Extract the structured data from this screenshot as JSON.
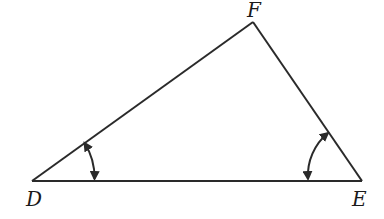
{
  "diagram": {
    "type": "triangle",
    "stroke_color": "#2a2a2a",
    "vertices": {
      "D": {
        "label": "D",
        "x": 32,
        "y": 181
      },
      "E": {
        "label": "E",
        "x": 362,
        "y": 181
      },
      "F": {
        "label": "F",
        "x": 253,
        "y": 22
      }
    },
    "sides": [
      "DE",
      "EF",
      "FD"
    ],
    "angle_marks": [
      {
        "vertex": "D",
        "style": "double-arrow-arc"
      },
      {
        "vertex": "E",
        "style": "double-arrow-arc"
      }
    ]
  }
}
